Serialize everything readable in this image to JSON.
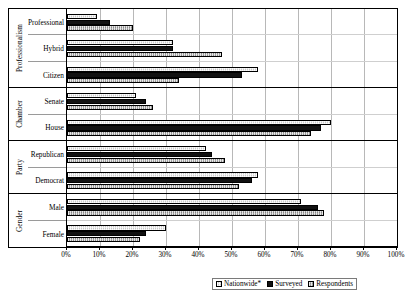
{
  "chart_data": {
    "type": "bar",
    "orientation": "horizontal",
    "title": "",
    "xlabel": "",
    "ylabel": "",
    "xlim": [
      0,
      100
    ],
    "grid": true,
    "legend_position": "bottom",
    "xtick_labels": [
      "0%",
      "10%",
      "20%",
      "30%",
      "40%",
      "50%",
      "60%",
      "70%",
      "80%",
      "90%",
      "100%"
    ],
    "xtick_values": [
      0,
      10,
      20,
      30,
      40,
      50,
      60,
      70,
      80,
      90,
      100
    ],
    "group_axis_labels": [
      "Professionalism",
      "Chamber",
      "Party",
      "Gender"
    ],
    "groups": [
      {
        "name": "Professionalism",
        "categories": [
          "Professional",
          "Hybrid",
          "Citizen"
        ]
      },
      {
        "name": "Chamber",
        "categories": [
          "Senate",
          "House"
        ]
      },
      {
        "name": "Party",
        "categories": [
          "Republican",
          "Democrat"
        ]
      },
      {
        "name": "Gender",
        "categories": [
          "Male",
          "Female"
        ]
      }
    ],
    "categories": [
      "Professional",
      "Hybrid",
      "Citizen",
      "Senate",
      "House",
      "Republican",
      "Democrat",
      "Male",
      "Female"
    ],
    "series": [
      {
        "name": "Nationwide*",
        "values": [
          9,
          32,
          58,
          21,
          80,
          42,
          58,
          71,
          30
        ]
      },
      {
        "name": "Surveyed",
        "values": [
          13,
          32,
          53,
          24,
          77,
          44,
          56,
          76,
          24
        ]
      },
      {
        "name": "Respondents",
        "values": [
          20,
          47,
          34,
          26,
          74,
          48,
          52,
          78,
          22
        ]
      }
    ]
  },
  "legend": {
    "items": [
      {
        "label": "Nationwide*",
        "swatch": "hatched-light"
      },
      {
        "label": "Surveyed",
        "swatch": "solid-black"
      },
      {
        "label": "Respondents",
        "swatch": "hatched-gray"
      }
    ]
  }
}
